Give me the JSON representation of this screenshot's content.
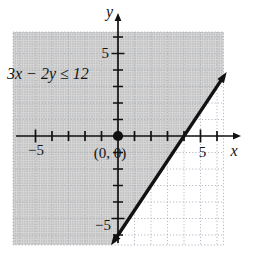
{
  "labels": {
    "inequality": "3x − 2y ≤ 12",
    "origin_point": "(0, 0)",
    "x_axis": "x",
    "y_axis": "y",
    "x_tick_pos": "5",
    "x_tick_neg": "−5",
    "y_tick_pos": "5",
    "y_tick_neg": "−5"
  },
  "colors": {
    "ink": "#111111",
    "shading_dot": "#bdbdbd",
    "shading_bg": "#d8d8d8",
    "grid": "#a9b2bd"
  },
  "chart_data": {
    "type": "line",
    "title": "",
    "inequality": "3x − 2y ≤ 12",
    "boundary_line": {
      "equation": "3x − 2y = 12",
      "slope": 1.5,
      "y_intercept": -6,
      "x_intercept": 4,
      "style": "solid (boundary included, ≤)"
    },
    "shaded_region": "half-plane above-left of the boundary line (solution set containing (0, 0))",
    "marked_points": [
      [
        0,
        0
      ]
    ],
    "xlabel": "x",
    "ylabel": "y",
    "xlim": [
      -6.4,
      6.4
    ],
    "ylim": [
      -6.6,
      6.3
    ],
    "tick_interval": 1,
    "x_ticks": [
      -5,
      -4,
      -3,
      -2,
      -1,
      1,
      2,
      3,
      4,
      5,
      6
    ],
    "y_ticks": [
      -6,
      -5,
      -4,
      -3,
      -2,
      -1,
      1,
      2,
      3,
      4,
      5,
      6
    ],
    "labeled_x_ticks": [
      -5,
      5
    ],
    "labeled_y_ticks": [
      -5,
      5
    ],
    "grid": true,
    "grid_style": "dotted"
  }
}
